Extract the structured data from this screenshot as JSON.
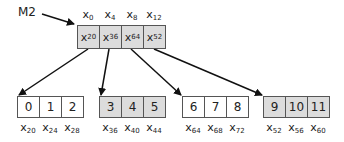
{
  "pointer_label": "M2",
  "top_block": {
    "addresses": [
      "0",
      "4",
      "8",
      "12"
    ],
    "cells": [
      "20",
      "36",
      "64",
      "52"
    ],
    "shaded": true
  },
  "leaf_blocks": [
    {
      "values": [
        "0",
        "1",
        "2"
      ],
      "addresses": [
        "20",
        "24",
        "28"
      ],
      "shaded": false
    },
    {
      "values": [
        "3",
        "4",
        "5"
      ],
      "addresses": [
        "36",
        "40",
        "44"
      ],
      "shaded": true
    },
    {
      "values": [
        "6",
        "7",
        "8"
      ],
      "addresses": [
        "64",
        "68",
        "72"
      ],
      "shaded": false
    },
    {
      "values": [
        "9",
        "10",
        "11"
      ],
      "addresses": [
        "52",
        "56",
        "60"
      ],
      "shaded": true
    }
  ],
  "address_prefix": "x",
  "colors": {
    "shaded": "#dcdcdc",
    "border": "#555555",
    "arrow": "#111111"
  }
}
